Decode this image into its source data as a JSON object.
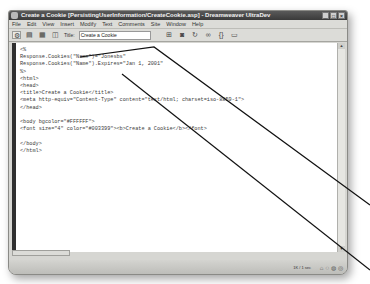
{
  "window": {
    "title": "Create a Cookie [PersistingUserInformation/CreateCookie.asp] - Dreamweaver UltraDev",
    "buttons": {
      "minimize": "_",
      "maximize": "□",
      "close": "×"
    }
  },
  "menubar": {
    "items": [
      "File",
      "Edit",
      "View",
      "Insert",
      "Modify",
      "Text",
      "Comments",
      "Site",
      "Window",
      "Help"
    ]
  },
  "toolbar": {
    "title_label": "Title:",
    "title_value": "Create a Cookie",
    "icons": [
      "code-view-icon",
      "split-view-icon",
      "design-view-icon",
      "live-data-icon",
      "file-management-icon",
      "preview-icon",
      "refresh-icon",
      "reference-icon",
      "code-nav-icon",
      "view-options-icon"
    ]
  },
  "code": {
    "lines": [
      "<%",
      "Response.Cookies(\"Name\")=\"Jonesbs\"",
      "Response.Cookies(\"Name\").Expires=\"Jan 1, 2001\"",
      "%>",
      "<html>",
      "<head>",
      "<title>Create a Cookie</title>",
      "<meta http-equiv=\"Content-Type\" content=\"text/html; charset=iso-8859-1\">",
      "</head>",
      "",
      "<body bgcolor=\"#FFFFFF\">",
      "<font size=\"4\" color=\"#003399\"><b>Create a Cookie</b></font>",
      "",
      "</body>",
      "</html>"
    ]
  },
  "statusbar": {
    "size": "1K / 1 sec"
  },
  "colors": {
    "titlebar": "#3a3a3a",
    "chrome": "#d6d6d2",
    "code_bg": "#ffffff",
    "callout_line": "#111111"
  }
}
